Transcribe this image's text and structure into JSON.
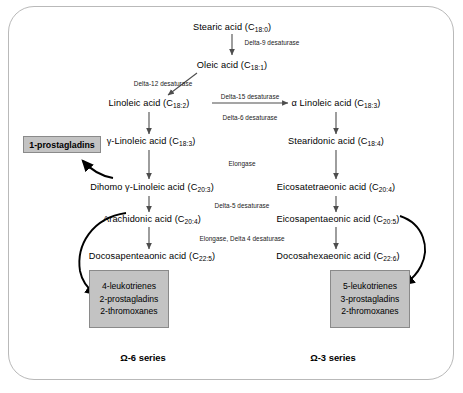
{
  "diagram": {
    "title_frame": "fatty-acid-desaturation-elongation-pathway",
    "nodes": {
      "stearic": {
        "name": "Stearic acid (C",
        "sub": "18:0",
        "close": ")"
      },
      "oleic": {
        "name": "Oleic acid (C",
        "sub": "18:1",
        "close": ")"
      },
      "linoleic": {
        "name": "Linoleic acid (C",
        "sub": "18:2",
        "close": ")"
      },
      "alpha_linoleic": {
        "name": "α Linoleic acid (C",
        "sub": "18:3",
        "close": ")"
      },
      "gamma_linoleic": {
        "name": "γ-Linoleic acid (C",
        "sub": "18:3",
        "close": ")"
      },
      "stearidonic": {
        "name": "Stearidonic acid (C",
        "sub": "18:4",
        "close": ")"
      },
      "dihomo_gamma": {
        "name": "Dihomo γ-Linoleic acid (C",
        "sub": "20:3",
        "close": ")"
      },
      "eicosatetraeonic": {
        "name": "Eicosatetraeonic acid (C",
        "sub": "20:4",
        "close": ")"
      },
      "arachidonic": {
        "name": "Arachidonic acid (C",
        "sub": "20:4",
        "close": ")"
      },
      "eicosapentaeonic": {
        "name": "Eicosapentaeonic acid (C",
        "sub": "20:5",
        "close": ")"
      },
      "docosapenteaonic": {
        "name": "Docosapenteaonic acid (C",
        "sub": "22:5",
        "close": ")"
      },
      "docosahexaeonic": {
        "name": "Docosahexaeonic acid (C",
        "sub": "22:6",
        "close": ")"
      }
    },
    "enzymes": {
      "delta9": "Delta-9 desaturase",
      "delta12": "Delta-12 desaturase",
      "delta15": "Delta-15 desaturase",
      "delta6": "Delta-6 desaturase",
      "elongase": "Elongase",
      "delta5": "Delta-5 desaturase",
      "elongase_delta4": "Elongase, Delta 4 desaturase"
    },
    "boxes": {
      "prostagladins1": "1-prostagladins",
      "omega6_products": [
        "4-leukotrienes",
        "2-prostagladins",
        "2-thromoxanes"
      ],
      "omega3_products": [
        "5-leukotrienes",
        "3-prostagladins",
        "2-thromoxanes"
      ]
    },
    "series_labels": {
      "omega6": "Ω-6 series",
      "omega3": "Ω-3 series"
    },
    "colors": {
      "box_fill": "#c3c3c3",
      "box_border": "#8a8a8a",
      "frame_border": "#b9b9b9",
      "arrow": "#4d4d4d",
      "curve": "#000000",
      "text": "#000000"
    }
  }
}
